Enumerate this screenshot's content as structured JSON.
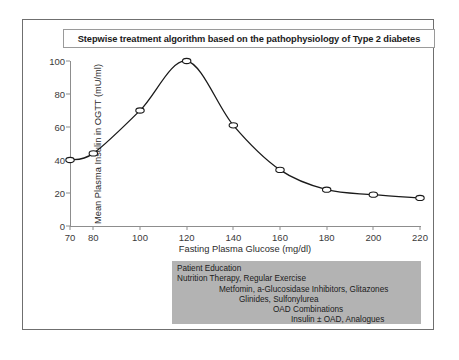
{
  "title": "Stepwise treatment algorithm based on the pathophysiology of Type 2 diabetes",
  "chart_data": {
    "type": "line",
    "title": "Stepwise treatment algorithm based on the pathophysiology of Type 2 diabetes",
    "xlabel": "Fasting Plasma Glucose (mg/dl)",
    "ylabel": "Mean Plasma Insulin in OGTT (mU/ml)",
    "x": [
      70,
      80,
      100,
      120,
      140,
      160,
      180,
      200,
      220
    ],
    "values": [
      40,
      44,
      70,
      100,
      61,
      34,
      22,
      19,
      17
    ],
    "xlim": [
      70,
      220
    ],
    "ylim": [
      0,
      100
    ],
    "xticks": [
      "70",
      "80",
      "100",
      "120",
      "140",
      "160",
      "180",
      "200",
      "220"
    ],
    "yticks": [
      "0",
      "20",
      "40",
      "60",
      "80",
      "100"
    ],
    "grid": false,
    "legend": false,
    "marker": "open-circle",
    "line_color": "#1a1a1a"
  },
  "treatment_box": {
    "background": "#b3b3b3",
    "lines": [
      "Patient Education",
      "Nutrition Therapy, Regular Exercise",
      "Metfomin, a-Glucosidase Inhibitors, Glitazones",
      "Glinides, Sulfonylurea",
      "OAD Combinations",
      "Insulin ± OAD, Analogues"
    ]
  }
}
